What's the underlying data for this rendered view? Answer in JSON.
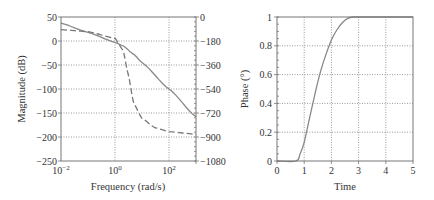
{
  "chart_data": [
    {
      "type": "line",
      "title": "",
      "xlabel": "Frequency (rad/s)",
      "ylabel": "Magnitude (dB)",
      "y2label": "",
      "xscale": "log",
      "xlim": [
        0.01,
        1000
      ],
      "ylim": [
        -250,
        50
      ],
      "y2lim": [
        -1080,
        0
      ],
      "grid": true,
      "x_ticks": [
        "10^-2",
        "10^0",
        "10^2"
      ],
      "y_ticks": [
        "50",
        "0",
        "−50",
        "−100",
        "−150",
        "−200",
        "−250"
      ],
      "y2_ticks": [
        "0",
        "−180",
        "−360",
        "−540",
        "−720",
        "−900",
        "−1080"
      ],
      "series": [
        {
          "name": "Magnitude",
          "style": "solid",
          "axis": "left",
          "x": [
            0.01,
            0.1,
            1,
            2,
            5,
            10,
            100,
            1000
          ],
          "y": [
            37,
            18,
            -3,
            -10,
            -28,
            -45,
            -100,
            -158
          ]
        },
        {
          "name": "Phase",
          "style": "dashed",
          "axis": "right",
          "x": [
            0.01,
            0.1,
            1,
            2,
            3,
            5,
            10,
            30,
            100,
            1000
          ],
          "y": [
            -95,
            -110,
            -160,
            -250,
            -420,
            -650,
            -760,
            -830,
            -860,
            -880
          ]
        }
      ]
    },
    {
      "type": "line",
      "title": "",
      "xlabel": "Time",
      "ylabel": "Phase (°)",
      "xlim": [
        0,
        5
      ],
      "ylim": [
        0,
        1
      ],
      "grid": true,
      "x_ticks": [
        "0",
        "1",
        "2",
        "3",
        "4",
        "5"
      ],
      "y_ticks": [
        "0",
        "0.2",
        "0.4",
        "0.6",
        "0.8",
        "1"
      ],
      "series": [
        {
          "name": "Response",
          "style": "solid",
          "x": [
            0,
            0.7,
            0.85,
            1.0,
            1.2,
            1.4,
            1.6,
            1.8,
            2.0,
            2.2,
            2.4,
            2.6,
            2.8,
            3.0,
            5.0
          ],
          "y": [
            0,
            0,
            0.05,
            0.13,
            0.3,
            0.47,
            0.62,
            0.74,
            0.84,
            0.91,
            0.96,
            0.99,
            1.0,
            1.0,
            1.0
          ]
        }
      ]
    }
  ]
}
